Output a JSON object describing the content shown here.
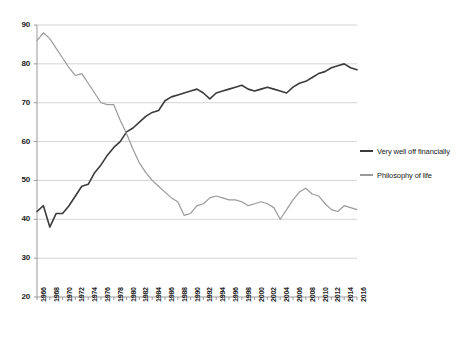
{
  "chart_data": {
    "type": "line",
    "title": "",
    "subtitle": "",
    "xlabel": "",
    "ylabel": "",
    "xlim": [
      1966,
      2016
    ],
    "ylim": [
      20,
      90
    ],
    "y_ticks": [
      20,
      30,
      40,
      50,
      60,
      70,
      80,
      90
    ],
    "grid": true,
    "legend_position": "right",
    "x": [
      1966,
      1967,
      1968,
      1969,
      1970,
      1971,
      1972,
      1973,
      1974,
      1975,
      1976,
      1977,
      1978,
      1979,
      1980,
      1981,
      1982,
      1983,
      1984,
      1985,
      1986,
      1987,
      1988,
      1989,
      1990,
      1991,
      1992,
      1993,
      1994,
      1995,
      1996,
      1997,
      1998,
      1999,
      2000,
      2001,
      2002,
      2003,
      2004,
      2005,
      2006,
      2007,
      2008,
      2009,
      2010,
      2011,
      2012,
      2013,
      2014,
      2015,
      2016
    ],
    "x_tick_labels": [
      "1966",
      "1968",
      "1970",
      "1972",
      "1974",
      "1976",
      "1978",
      "1980",
      "1982",
      "1984",
      "1986",
      "1988",
      "1990",
      "1992",
      "1994",
      "1996",
      "1998",
      "2000",
      "2002",
      "2004",
      "2006",
      "2008",
      "2010",
      "2012",
      "2014",
      "2016"
    ],
    "series": [
      {
        "name": "Very well off financially",
        "color": "#3b3b3b",
        "values": [
          42.0,
          43.5,
          38.0,
          41.5,
          41.5,
          43.5,
          46.0,
          48.5,
          49.0,
          52.0,
          54.0,
          56.5,
          58.5,
          60.0,
          62.5,
          63.5,
          65.0,
          66.5,
          67.5,
          68.0,
          70.5,
          71.5,
          72.0,
          72.5,
          73.0,
          73.5,
          72.5,
          71.0,
          72.5,
          73.0,
          73.5,
          74.0,
          74.5,
          73.5,
          73.0,
          73.5,
          74.0,
          73.5,
          73.0,
          72.5,
          74.0,
          75.0,
          75.5,
          76.5,
          77.5,
          78.0,
          79.0,
          79.5,
          80.0,
          79.0,
          78.5
        ]
      },
      {
        "name": "Philosophy of life",
        "color": "#9a9a9a",
        "values": [
          86.0,
          88.0,
          86.5,
          84.0,
          81.5,
          79.0,
          77.0,
          77.5,
          75.0,
          72.5,
          70.0,
          69.5,
          69.5,
          65.5,
          62.0,
          58.0,
          54.5,
          52.0,
          50.0,
          48.5,
          47.0,
          45.5,
          44.5,
          41.0,
          41.5,
          43.5,
          44.0,
          45.5,
          46.0,
          45.5,
          45.0,
          45.0,
          44.5,
          43.5,
          44.0,
          44.5,
          44.0,
          43.0,
          40.0,
          42.5,
          45.0,
          47.0,
          48.0,
          46.5,
          46.0,
          44.0,
          42.5,
          42.0,
          43.5,
          43.0,
          42.5
        ]
      }
    ]
  },
  "legend": {
    "items": [
      {
        "label": "Very well off financially"
      },
      {
        "label": "Philosophy of life"
      }
    ]
  }
}
